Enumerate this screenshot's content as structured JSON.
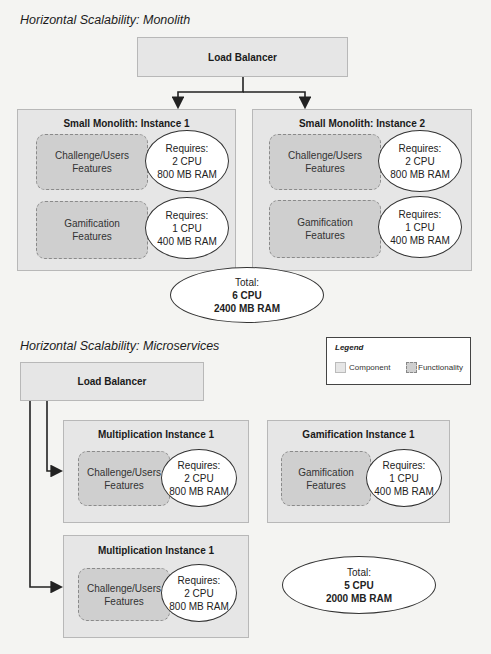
{
  "monolith": {
    "title": "Horizontal Scalability: Monolith",
    "load_balancer": "Load Balancer",
    "instances": [
      {
        "title": "Small Monolith: Instance 1",
        "features": [
          {
            "name_line1": "Challenge/Users",
            "name_line2": "Features",
            "req_label": "Requires:",
            "cpu": "2 CPU",
            "ram": "800 MB RAM"
          },
          {
            "name_line1": "Gamification",
            "name_line2": "Features",
            "req_label": "Requires:",
            "cpu": "1 CPU",
            "ram": "400 MB RAM"
          }
        ]
      },
      {
        "title": "Small Monolith: Instance 2",
        "features": [
          {
            "name_line1": "Challenge/Users",
            "name_line2": "Features",
            "req_label": "Requires:",
            "cpu": "2 CPU",
            "ram": "800 MB RAM"
          },
          {
            "name_line1": "Gamification",
            "name_line2": "Features",
            "req_label": "Requires:",
            "cpu": "1 CPU",
            "ram": "400 MB RAM"
          }
        ]
      }
    ],
    "total": {
      "label": "Total:",
      "cpu": "6 CPU",
      "ram": "2400 MB RAM"
    }
  },
  "microservices": {
    "title": "Horizontal Scalability: Microservices",
    "load_balancer": "Load Balancer",
    "instances": [
      {
        "title": "Multiplication Instance 1",
        "feature_line1": "Challenge/Users",
        "feature_line2": "Features",
        "req_label": "Requires:",
        "cpu": "2 CPU",
        "ram": "800 MB RAM"
      },
      {
        "title": "Gamification Instance 1",
        "feature_line1": "Gamification",
        "feature_line2": "Features",
        "req_label": "Requires:",
        "cpu": "1 CPU",
        "ram": "400 MB RAM"
      },
      {
        "title": "Multiplication Instance 1",
        "feature_line1": "Challenge/Users",
        "feature_line2": "Features",
        "req_label": "Requires:",
        "cpu": "2 CPU",
        "ram": "800 MB RAM"
      }
    ],
    "total": {
      "label": "Total:",
      "cpu": "5 CPU",
      "ram": "2000 MB RAM"
    }
  },
  "legend": {
    "title": "Legend",
    "items": [
      {
        "label": "Component",
        "color": "#e6e6e6"
      },
      {
        "label": "Functionality",
        "color": "#cfcfcf"
      }
    ]
  }
}
